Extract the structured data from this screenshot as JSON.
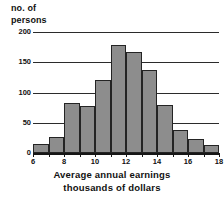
{
  "chart_data": {
    "type": "bar",
    "title": "",
    "xlabel": "Average annual earnings thousands of dollars",
    "xlabel_lines": [
      "Average annual earnings",
      "thousands of dollars"
    ],
    "ylabel": "no. of persons",
    "ylabel_lines": [
      "no. of",
      "persons"
    ],
    "categories": [
      "6-7",
      "7-8",
      "8-9",
      "9-10",
      "10-11",
      "11-12",
      "12-13",
      "13-14",
      "14-15",
      "15-16",
      "16-17",
      "17-18"
    ],
    "bin_edges": [
      6,
      7,
      8,
      9,
      10,
      11,
      12,
      13,
      14,
      15,
      16,
      17,
      18
    ],
    "values": [
      15,
      27,
      83,
      78,
      120,
      178,
      167,
      138,
      80,
      38,
      23,
      14
    ],
    "xlim": [
      6,
      18
    ],
    "ylim": [
      0,
      200
    ],
    "y_ticks": [
      0,
      50,
      100,
      150,
      200
    ],
    "y_tick_labels": [
      "0",
      "50",
      "100",
      "150",
      "200"
    ],
    "x_ticks": [
      6,
      7,
      8,
      9,
      10,
      11,
      12,
      13,
      14,
      15,
      16,
      17,
      18
    ],
    "x_tick_labels": [
      "6",
      "",
      "8",
      "",
      "10",
      "",
      "12",
      "",
      "14",
      "",
      "16",
      "",
      "18"
    ],
    "grid": true,
    "grid_axis": "y",
    "legend": false,
    "bar_color": "#8d8d8d",
    "bar_edge_color": "#242424",
    "axis_color": "#161616",
    "grid_color": "#2b2b2b",
    "background_color": "#ffffff"
  }
}
